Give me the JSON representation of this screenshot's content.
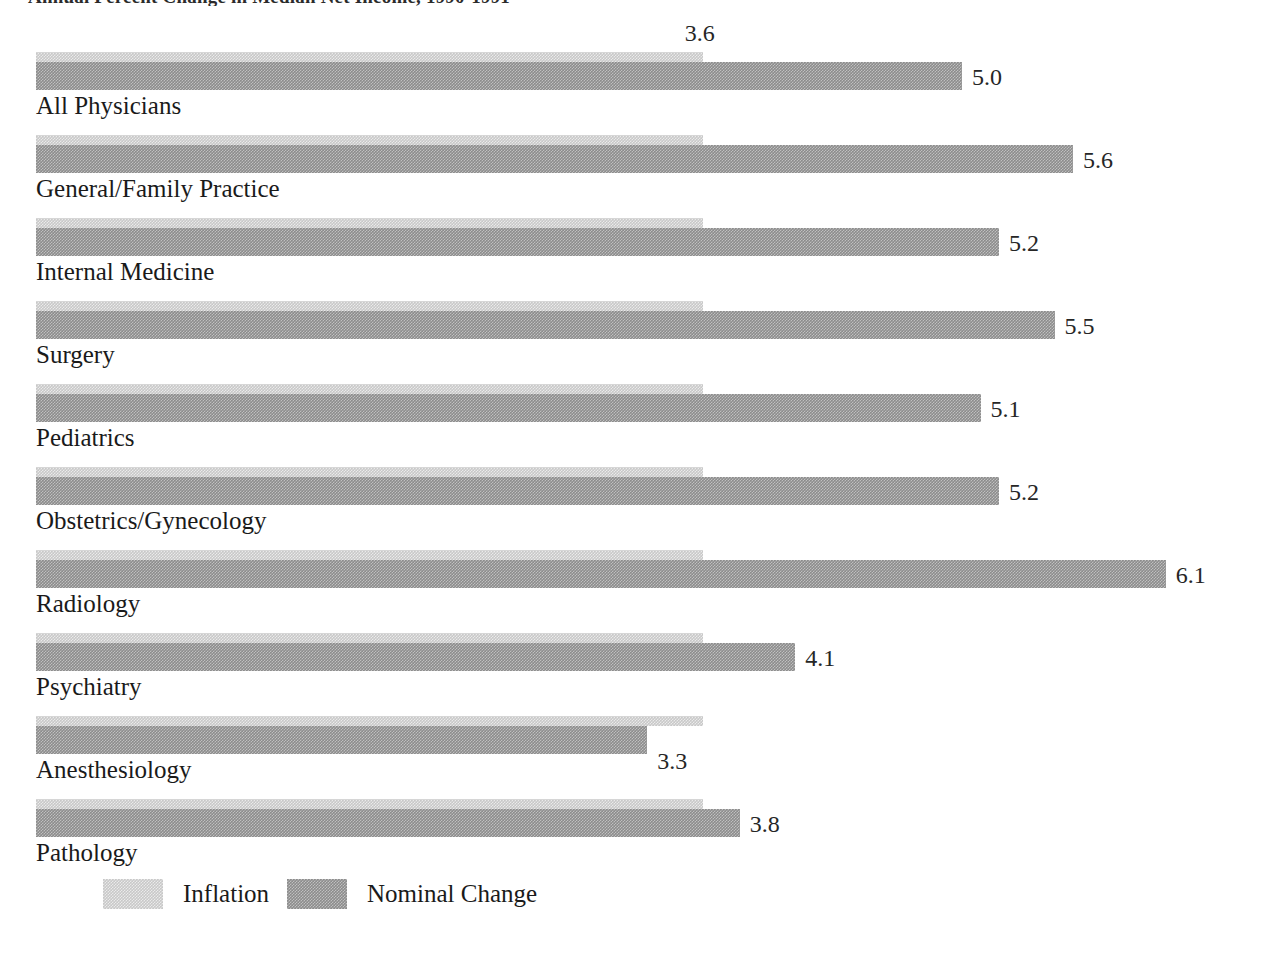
{
  "title": "Annual Percent Change in Median Net Income, 1990-1991",
  "chart_data": {
    "type": "bar",
    "orientation": "horizontal",
    "title": "Annual Percent Change in Median Net Income, 1990-1991",
    "xlabel": "",
    "ylabel": "",
    "grid": false,
    "xlim": [
      0,
      6.6
    ],
    "legend_position": "bottom-left",
    "categories": [
      "All Physicians",
      "General/Family Practice",
      "Internal Medicine",
      "Surgery",
      "Pediatrics",
      "Obstetrics/Gynecology",
      "Radiology",
      "Psychiatry",
      "Anesthesiology",
      "Pathology"
    ],
    "series": [
      {
        "name": "Inflation",
        "color": "#c8c8c8",
        "values": [
          3.6,
          3.6,
          3.6,
          3.6,
          3.6,
          3.6,
          3.6,
          3.6,
          3.6,
          3.6
        ]
      },
      {
        "name": "Nominal Change",
        "color": "#8c8c8c",
        "values": [
          5.0,
          5.6,
          5.2,
          5.5,
          5.1,
          5.2,
          6.1,
          4.1,
          3.3,
          3.8
        ]
      }
    ],
    "inflation_label_shown_on_first_row_only": "3.6",
    "value_labels": [
      "5.0",
      "5.6",
      "5.2",
      "5.5",
      "5.1",
      "5.2",
      "6.1",
      "4.1",
      "3.3",
      "3.8"
    ]
  },
  "rows": [
    {
      "label": "All Physicians",
      "inflation": 3.6,
      "nominal": 5.0,
      "nominal_label": "5.0",
      "inflation_label": "3.6",
      "show_inflation_label": true,
      "label_below": false
    },
    {
      "label": "General/Family Practice",
      "inflation": 3.6,
      "nominal": 5.6,
      "nominal_label": "5.6",
      "inflation_label": "3.6",
      "show_inflation_label": false,
      "label_below": false
    },
    {
      "label": "Internal Medicine",
      "inflation": 3.6,
      "nominal": 5.2,
      "nominal_label": "5.2",
      "inflation_label": "3.6",
      "show_inflation_label": false,
      "label_below": false
    },
    {
      "label": "Surgery",
      "inflation": 3.6,
      "nominal": 5.5,
      "nominal_label": "5.5",
      "inflation_label": "3.6",
      "show_inflation_label": false,
      "label_below": false
    },
    {
      "label": "Pediatrics",
      "inflation": 3.6,
      "nominal": 5.1,
      "nominal_label": "5.1",
      "inflation_label": "3.6",
      "show_inflation_label": false,
      "label_below": false
    },
    {
      "label": "Obstetrics/Gynecology",
      "inflation": 3.6,
      "nominal": 5.2,
      "nominal_label": "5.2",
      "inflation_label": "3.6",
      "show_inflation_label": false,
      "label_below": false
    },
    {
      "label": "Radiology",
      "inflation": 3.6,
      "nominal": 6.1,
      "nominal_label": "6.1",
      "inflation_label": "3.6",
      "show_inflation_label": false,
      "label_below": false
    },
    {
      "label": "Psychiatry",
      "inflation": 3.6,
      "nominal": 4.1,
      "nominal_label": "4.1",
      "inflation_label": "3.6",
      "show_inflation_label": false,
      "label_below": false
    },
    {
      "label": "Anesthesiology",
      "inflation": 3.6,
      "nominal": 3.3,
      "nominal_label": "3.3",
      "inflation_label": "3.6",
      "show_inflation_label": false,
      "label_below": true
    },
    {
      "label": "Pathology",
      "inflation": 3.6,
      "nominal": 3.8,
      "nominal_label": "3.8",
      "inflation_label": "3.6",
      "show_inflation_label": false,
      "label_below": false
    }
  ],
  "legend": {
    "items": [
      {
        "label": "Inflation",
        "color": "#c8c8c8"
      },
      {
        "label": "Nominal Change",
        "color": "#8c8c8c"
      }
    ]
  },
  "scale": {
    "origin_x": 36,
    "px_per_unit": 185.2
  }
}
